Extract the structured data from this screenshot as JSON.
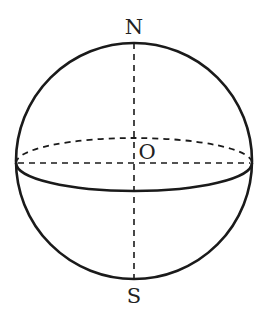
{
  "diagram": {
    "type": "sphere",
    "labels": {
      "north": "N",
      "center": "O",
      "south": "S"
    },
    "geometry": {
      "center": [
        134,
        161
      ],
      "radius": 118,
      "equator_ry": 27,
      "equator_cy": 163
    },
    "colors": {
      "stroke": "#1a1a1a",
      "background": "#ffffff"
    }
  }
}
